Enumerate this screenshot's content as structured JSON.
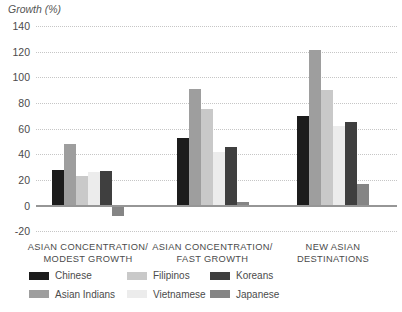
{
  "chart_data": {
    "type": "bar",
    "title": "Growth (%)",
    "categories": [
      [
        "ASIAN CONCENTRATION/",
        "MODEST GROWTH"
      ],
      [
        "ASIAN CONCENTRATION/",
        "FAST GROWTH"
      ],
      [
        "NEW ASIAN",
        "DESTINATIONS"
      ]
    ],
    "series": [
      {
        "name": "Chinese",
        "color": "#1c1c1c",
        "values": [
          28,
          53,
          70
        ]
      },
      {
        "name": "Asian Indians",
        "color": "#9e9e9e",
        "values": [
          48,
          91,
          121
        ]
      },
      {
        "name": "Filipinos",
        "color": "#c9c9c9",
        "values": [
          23,
          75,
          90
        ]
      },
      {
        "name": "Vietnamese",
        "color": "#ececec",
        "values": [
          26,
          42,
          62
        ]
      },
      {
        "name": "Koreans",
        "color": "#3f3f3f",
        "values": [
          27,
          46,
          65
        ]
      },
      {
        "name": "Japanese",
        "color": "#858585",
        "values": [
          -7,
          3,
          17
        ]
      }
    ],
    "ylabel": "Growth (%)",
    "xlabel": "",
    "ylim": [
      -20,
      140
    ],
    "yticks": [
      140,
      120,
      100,
      80,
      60,
      40,
      20,
      0,
      -20
    ],
    "grid": "horizontal-dotted",
    "legend_position": "bottom",
    "colors": {
      "grid": "#c6c6c6",
      "axis_line": "#969696",
      "text": "#4b4b4b",
      "title_text": "#555555",
      "background": "#ffffff"
    }
  }
}
